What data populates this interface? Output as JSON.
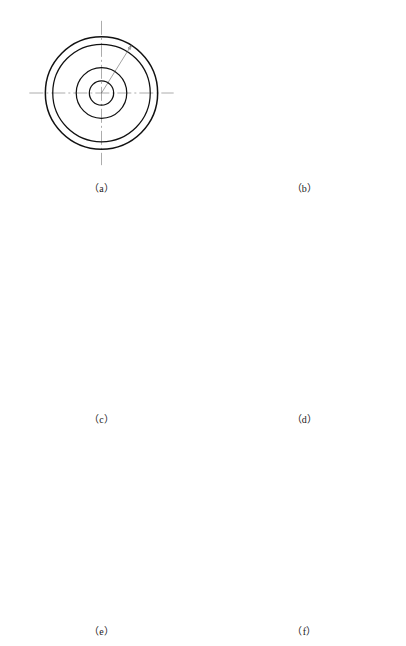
{
  "figure": {
    "panel_count": 6,
    "grid": "2 columns x 3 rows"
  },
  "dimensions": {
    "outer_diameter": "φ80.8",
    "bolt_circle_diameter": "φ70",
    "hub_diameter": "φ36.3",
    "bore_diameter": "φ17.5",
    "keyway_depth": "19.6"
  },
  "panels": [
    {
      "id": "a",
      "caption": "（a）",
      "description": "Four concentric circles with diameter leader callouts",
      "circle_count": 4,
      "labels": [
        "φ80.8",
        "φ70",
        "φ36.3",
        "φ17.5"
      ]
    },
    {
      "id": "b",
      "caption": "（b）",
      "description": "Bore with keyway and vertical dimension",
      "circle_count": 4,
      "labels": [
        "19.6"
      ]
    },
    {
      "id": "c",
      "caption": "（c）",
      "description": "Twelve radial division lines at 30 degree spacing",
      "divisions": 12,
      "labels": []
    },
    {
      "id": "d",
      "caption": "（d）",
      "description": "Inscribed chord polygon added over division points",
      "divisions": 12,
      "labels": []
    },
    {
      "id": "e",
      "caption": "（e）",
      "description": "Chord polygon and tooth layout construction complete",
      "divisions": 12,
      "labels": []
    },
    {
      "id": "f",
      "caption": "（f）",
      "description": "Finished milling cutter outline with twelve teeth, bore and keyway",
      "teeth": 12,
      "labels": []
    }
  ]
}
